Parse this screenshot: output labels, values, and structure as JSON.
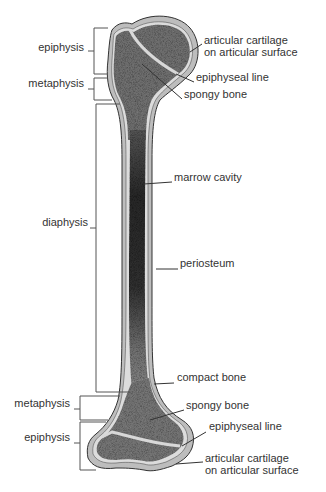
{
  "left_labels": [
    {
      "id": "epiphysis-top",
      "text": "epiphysis",
      "x": 4,
      "y": 47,
      "w": 80
    },
    {
      "id": "metaphysis-top",
      "text": "metaphysis",
      "x": 4,
      "y": 83,
      "w": 80
    },
    {
      "id": "diaphysis",
      "text": "diaphysis",
      "x": 4,
      "y": 222,
      "w": 84
    },
    {
      "id": "metaphysis-bottom",
      "text": "metaphysis",
      "x": 4,
      "y": 403,
      "w": 66
    },
    {
      "id": "epiphysis-bottom",
      "text": "epiphysis",
      "x": 4,
      "y": 437,
      "w": 66
    }
  ],
  "right_labels": [
    {
      "id": "articular-cartilage-top",
      "lines": [
        "articular cartilage",
        "on articular surface"
      ],
      "x": 204,
      "y": 40
    },
    {
      "id": "epiphyseal-line-top",
      "lines": [
        "epiphyseal line"
      ],
      "x": 196,
      "y": 77
    },
    {
      "id": "spongy-bone-top",
      "lines": [
        "spongy bone"
      ],
      "x": 184,
      "y": 94
    },
    {
      "id": "marrow-cavity",
      "lines": [
        "marrow cavity"
      ],
      "x": 174,
      "y": 177
    },
    {
      "id": "periosteum",
      "lines": [
        "periosteum"
      ],
      "x": 180,
      "y": 263
    },
    {
      "id": "compact-bone",
      "lines": [
        "compact bone"
      ],
      "x": 177,
      "y": 377
    },
    {
      "id": "spongy-bone-bottom",
      "lines": [
        "spongy bone"
      ],
      "x": 186,
      "y": 405
    },
    {
      "id": "epiphyseal-line-bottom",
      "lines": [
        "epiphyseal line"
      ],
      "x": 209,
      "y": 426
    },
    {
      "id": "articular-cartilage-bottom",
      "lines": [
        "articular cartilage",
        "on articular surface"
      ],
      "x": 205,
      "y": 458
    }
  ],
  "colors": {
    "text": "#333333",
    "line": "#333333",
    "cartilage": "#bdbdbd",
    "compact": "#d9d9d9",
    "spongy": "#6e6e6e",
    "marrow": "#2f2f2f"
  }
}
